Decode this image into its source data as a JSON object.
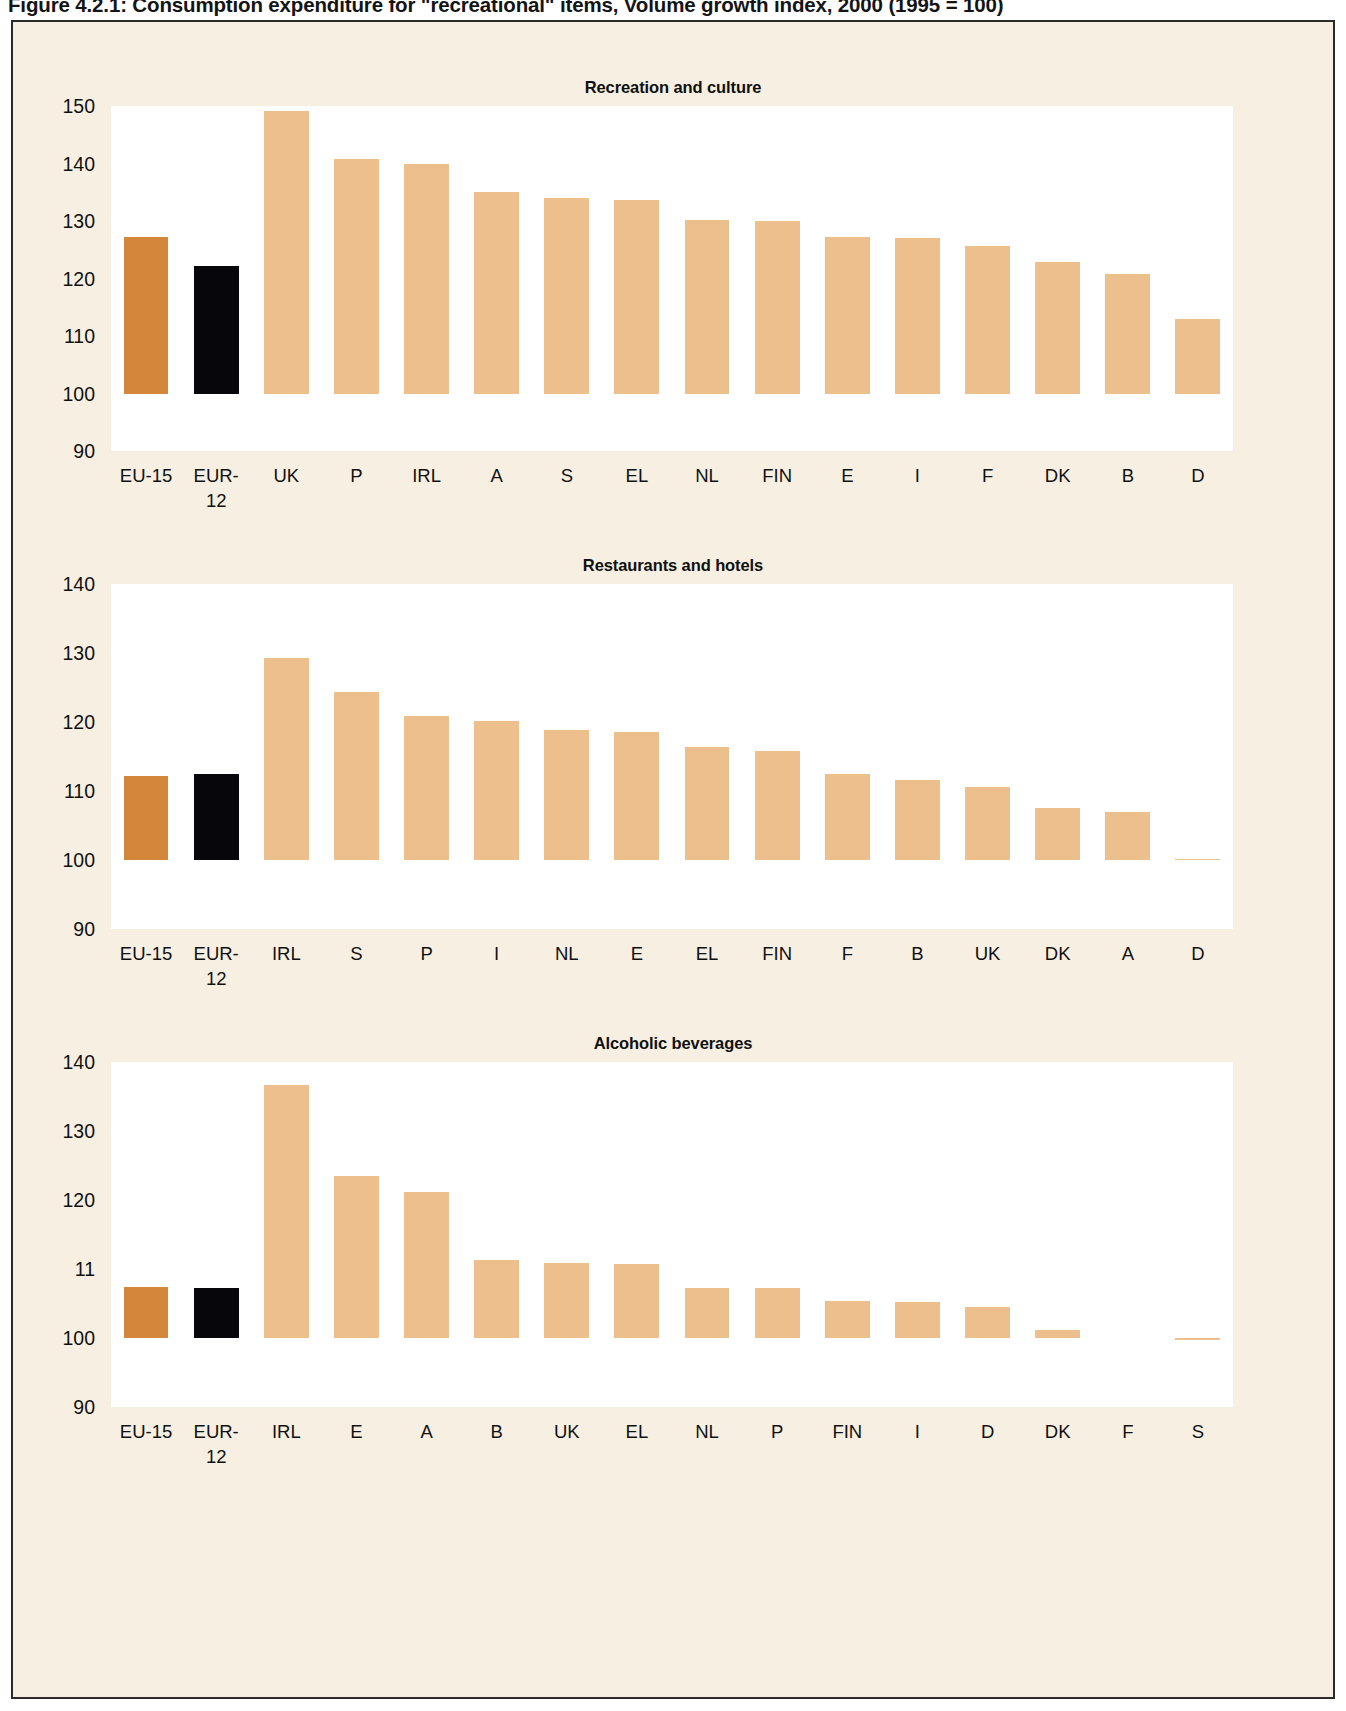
{
  "figure": {
    "caption": "Figure 4.2.1: Consumption expenditure for \"recreational\" items, Volume growth index, 2000 (1995 = 100)"
  },
  "colors": {
    "page_background": "#ffffff",
    "panel_background": "#f7f0e2",
    "plot_background": "#ffffff",
    "bar_default": "#edbf8d",
    "bar_eu15": "#d4863a",
    "bar_eur12": "#07060a",
    "frame": "#2b2b2b",
    "text": "#111111"
  },
  "chart_data": [
    {
      "type": "bar",
      "title": "Recreation and culture",
      "xlabel": "",
      "ylabel": "",
      "ylim": [
        90,
        150
      ],
      "yticks": [
        150,
        140,
        130,
        120,
        110,
        100,
        90
      ],
      "ytick_labels": [
        "150",
        "140",
        "130",
        "120",
        "110",
        "100",
        "90"
      ],
      "baseline": 100,
      "grid": false,
      "legend": "none",
      "categories": [
        "EU-15",
        "EUR-12",
        "UK",
        "P",
        "IRL",
        "A",
        "S",
        "EL",
        "NL",
        "FIN",
        "E",
        "I",
        "F",
        "DK",
        "B",
        "D"
      ],
      "category_lines": [
        [
          "EU-15"
        ],
        [
          "EUR-",
          "12"
        ],
        [
          "UK"
        ],
        [
          "P"
        ],
        [
          "IRL"
        ],
        [
          "A"
        ],
        [
          "S"
        ],
        [
          "EL"
        ],
        [
          "NL"
        ],
        [
          "FIN"
        ],
        [
          "E"
        ],
        [
          "I"
        ],
        [
          "F"
        ],
        [
          "DK"
        ],
        [
          "B"
        ],
        [
          "D"
        ]
      ],
      "values": [
        127.3,
        122.2,
        149.2,
        140.8,
        140.0,
        135.1,
        134.0,
        133.6,
        130.1,
        130.0,
        127.3,
        127.1,
        125.7,
        122.9,
        120.8,
        113.0
      ],
      "highlight": {
        "EU-15": "bar_eu15",
        "EUR-12": "bar_eur12"
      }
    },
    {
      "type": "bar",
      "title": "Restaurants and hotels",
      "xlabel": "",
      "ylabel": "",
      "ylim": [
        90,
        140
      ],
      "yticks": [
        140,
        130,
        120,
        110,
        100,
        90
      ],
      "ytick_labels": [
        "140",
        "130",
        "120",
        "110",
        "100",
        "90"
      ],
      "baseline": 100,
      "grid": false,
      "legend": "none",
      "categories": [
        "EU-15",
        "EUR-12",
        "IRL",
        "S",
        "P",
        "I",
        "NL",
        "E",
        "EL",
        "FIN",
        "F",
        "B",
        "UK",
        "DK",
        "A",
        "D"
      ],
      "category_lines": [
        [
          "EU-15"
        ],
        [
          "EUR-",
          "12"
        ],
        [
          "IRL"
        ],
        [
          "S"
        ],
        [
          "P"
        ],
        [
          "I"
        ],
        [
          "NL"
        ],
        [
          "E"
        ],
        [
          "EL"
        ],
        [
          "FIN"
        ],
        [
          "F"
        ],
        [
          "B"
        ],
        [
          "UK"
        ],
        [
          "DK"
        ],
        [
          "A"
        ],
        [
          "D"
        ]
      ],
      "values": [
        112.2,
        112.4,
        129.3,
        124.3,
        120.9,
        120.1,
        118.8,
        118.5,
        116.4,
        115.8,
        112.4,
        111.6,
        110.6,
        107.6,
        107.0,
        100.2
      ],
      "highlight": {
        "EU-15": "bar_eu15",
        "EUR-12": "bar_eur12"
      }
    },
    {
      "type": "bar",
      "title": "Alcoholic beverages",
      "xlabel": "",
      "ylabel": "",
      "ylim": [
        90,
        140
      ],
      "yticks": [
        140,
        130,
        120,
        110,
        100,
        90
      ],
      "ytick_labels": [
        "140",
        "130",
        "120",
        "11",
        "100",
        "90"
      ],
      "baseline": 100,
      "grid": false,
      "legend": "none",
      "categories": [
        "EU-15",
        "EUR-12",
        "IRL",
        "E",
        "A",
        "B",
        "UK",
        "EL",
        "NL",
        "P",
        "FIN",
        "I",
        "D",
        "DK",
        "F",
        "S"
      ],
      "category_lines": [
        [
          "EU-15"
        ],
        [
          "EUR-",
          "12"
        ],
        [
          "IRL"
        ],
        [
          "E"
        ],
        [
          "A"
        ],
        [
          "B"
        ],
        [
          "UK"
        ],
        [
          "EL"
        ],
        [
          "NL"
        ],
        [
          "P"
        ],
        [
          "FIN"
        ],
        [
          "I"
        ],
        [
          "D"
        ],
        [
          "DK"
        ],
        [
          "F"
        ],
        [
          "S"
        ]
      ],
      "values": [
        107.4,
        107.3,
        136.7,
        123.5,
        121.1,
        111.3,
        110.8,
        110.7,
        107.3,
        107.2,
        105.4,
        105.2,
        104.5,
        101.2,
        100.0,
        99.7
      ],
      "highlight": {
        "EU-15": "bar_eu15",
        "EUR-12": "bar_eur12"
      }
    }
  ]
}
